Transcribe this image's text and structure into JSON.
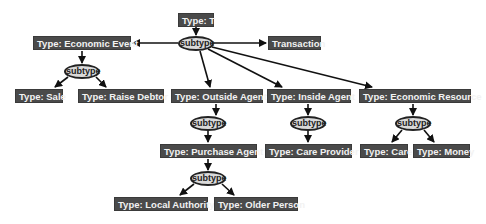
{
  "diagram": {
    "root": "Type: T",
    "relation_label": "subtype",
    "nodes": {
      "t": "Type: T",
      "transaction": "Transaction",
      "economic_event": "Type: Economic Event",
      "sale": "Type: Sale",
      "raise_debtor": "Type: Raise Debtor",
      "outside_agent": "Type: Outside Agent",
      "inside_agent": "Type: Inside Agent",
      "economic_resource": "Type: Economic Resource",
      "purchase_agent": "Type: Purchase Agent",
      "care_provider": "Type: Care Provider",
      "care": "Type: Care",
      "money": "Type: Money",
      "local_authority": "Type: Local Authority",
      "older_person": "Type: Older Person"
    },
    "subtype_labels": {
      "s_root": "subtype",
      "s_event": "subtype",
      "s_outside": "subtype",
      "s_inside": "subtype",
      "s_resource": "subtype",
      "s_purchase": "subtype"
    },
    "edges": [
      [
        "Type: T",
        "subtype"
      ],
      [
        "subtype",
        "Type: Economic Event"
      ],
      [
        "subtype",
        "Transaction"
      ],
      [
        "subtype",
        "Type: Outside Agent"
      ],
      [
        "subtype",
        "Type: Inside Agent"
      ],
      [
        "subtype",
        "Type: Economic Resource"
      ],
      [
        "Type: Economic Event",
        "subtype",
        "Type: Sale"
      ],
      [
        "Type: Economic Event",
        "subtype",
        "Type: Raise Debtor"
      ],
      [
        "Type: Outside Agent",
        "subtype",
        "Type: Purchase Agent"
      ],
      [
        "Type: Purchase Agent",
        "subtype",
        "Type: Local Authority"
      ],
      [
        "Type: Purchase Agent",
        "subtype",
        "Type: Older Person"
      ],
      [
        "Type: Inside Agent",
        "subtype",
        "Type: Care Provider"
      ],
      [
        "Type: Economic Resource",
        "subtype",
        "Type: Care"
      ],
      [
        "Type: Economic Resource",
        "subtype",
        "Type: Money"
      ]
    ],
    "colors": {
      "box_fill": "#4a4a4a",
      "box_text": "#f2f2f2",
      "ellipse_fill": "#d9d9d9",
      "edge": "#111111"
    }
  }
}
